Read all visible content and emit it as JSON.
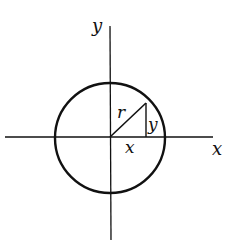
{
  "diagram": {
    "title": "",
    "axes": {
      "x_label": "x",
      "y_label": "y"
    },
    "circle": {
      "center": [
        110,
        138
      ],
      "radius": 55
    },
    "triangle": {
      "hypotenuse_label": "r",
      "base_label": "x",
      "height_label": "y"
    },
    "colors": {
      "stroke": "#111111",
      "background": "#ffffff"
    }
  }
}
